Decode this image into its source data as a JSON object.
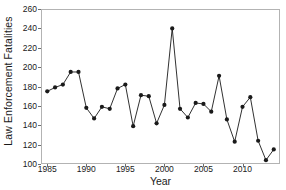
{
  "chart_data": {
    "type": "line",
    "title": "",
    "xlabel": "Year",
    "ylabel": "Law Enforcement Fatalities",
    "xlim": [
      1984.2,
      2014.8
    ],
    "ylim": [
      100,
      260
    ],
    "grid": false,
    "legend": null,
    "line_color": "#1a1a1a",
    "marker_color": "#1a1a1a",
    "marker": "circle",
    "frame_color": "#b3b3b3",
    "x_ticks": [
      1985,
      1990,
      1995,
      2000,
      2005,
      2010
    ],
    "x_tick_labels": [
      "1985",
      "1990",
      "1995",
      "2000",
      "2005",
      "2010"
    ],
    "y_ticks": [
      100,
      120,
      140,
      160,
      180,
      200,
      220,
      240,
      260
    ],
    "y_tick_labels": [
      "100",
      "120",
      "140",
      "160",
      "180",
      "200",
      "220",
      "240",
      "260"
    ],
    "x": [
      1985,
      1986,
      1987,
      1988,
      1989,
      1990,
      1991,
      1992,
      1993,
      1994,
      1995,
      1996,
      1997,
      1998,
      1999,
      2000,
      2001,
      2002,
      2003,
      2004,
      2005,
      2006,
      2007,
      2008,
      2009,
      2010,
      2011,
      2012,
      2013,
      2014
    ],
    "values": [
      175,
      179,
      182,
      195,
      195,
      158,
      147,
      159,
      157,
      178,
      182,
      139,
      171,
      170,
      142,
      161,
      240,
      157,
      148,
      163,
      162,
      154,
      191,
      146,
      123,
      159,
      169,
      124,
      104,
      115
    ],
    "series": [
      {
        "name": "Law Enforcement Fatalities",
        "values": [
          175,
          179,
          182,
          195,
          195,
          158,
          147,
          159,
          157,
          178,
          182,
          139,
          171,
          170,
          142,
          161,
          240,
          157,
          148,
          163,
          162,
          154,
          191,
          146,
          123,
          159,
          169,
          124,
          104,
          115
        ]
      }
    ]
  }
}
